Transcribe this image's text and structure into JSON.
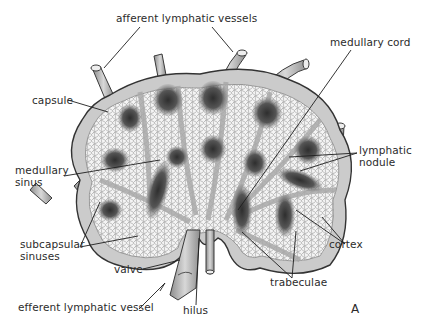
{
  "figure": {
    "panel_letter": "A",
    "colors": {
      "background": "#ffffff",
      "capsule": "#c9c9c9",
      "capsule_outline": "#3a3a3a",
      "sinus_mesh": "#f2f2f2",
      "trabecula": "#bdbdbd",
      "nodule_dark": "#3c3c3c",
      "vessel": "#b3b3b3",
      "leader_line": "#1e1e1e",
      "text": "#2b2b2b"
    }
  },
  "labels": {
    "afferent": "afferent lymphatic vessels",
    "medullary_cord": "medullary cord",
    "capsule": "capsule",
    "medullary_sinus_1": "medullary",
    "medullary_sinus_2": "sinus",
    "lymphatic_nodule_1": "lymphatic",
    "lymphatic_nodule_2": "nodule",
    "subcapsular_1": "subcapsular",
    "subcapsular_2": "sinuses",
    "cortex": "cortex",
    "valve": "valve",
    "trabeculae": "trabeculae",
    "efferent": "efferent lymphatic vessel",
    "hilus": "hilus"
  }
}
